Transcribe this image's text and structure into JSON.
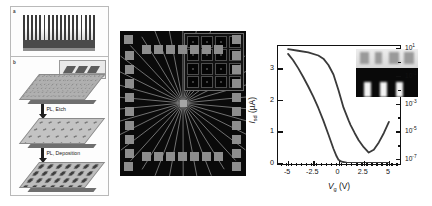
{
  "figure": {
    "panels": {
      "a": {
        "label": "a"
      },
      "b": {
        "label": "b",
        "steps": [
          {
            "arrow_label": "PL, Etch"
          },
          {
            "arrow_label": "PL, Deposition"
          }
        ]
      }
    }
  },
  "chart_data": {
    "type": "line",
    "title": "",
    "xlabel": "Vg (V)",
    "ylabel": "Isd (µA)",
    "xlabel_parts": {
      "symbol": "V",
      "sub": "g",
      "unit": "(V)"
    },
    "ylabel_parts": {
      "symbol": "I",
      "sub": "sd",
      "unit": "(µA)"
    },
    "grid": false,
    "legend": "none",
    "xlim": [
      -6,
      6
    ],
    "xticks": [
      -5,
      -2.5,
      0,
      2.5,
      5
    ],
    "xticklabels": [
      "-5",
      "-2.5",
      "0",
      "2.5",
      "5"
    ],
    "left_axis": {
      "scale": "linear",
      "ylim": [
        0,
        3.7
      ],
      "yticks": [
        0,
        1,
        2,
        3
      ],
      "yticklabels": [
        "0",
        "1",
        "2",
        "3"
      ]
    },
    "right_axis": {
      "scale": "log",
      "ylim": [
        1e-07,
        30.0
      ],
      "yticks": [
        "10^1",
        "10^-1",
        "10^-3",
        "10^-5",
        "10^-7"
      ],
      "yticklabels": [
        {
          "base": "10",
          "exp": "1"
        },
        {
          "base": "10",
          "exp": "-1"
        },
        {
          "base": "10",
          "exp": "-3"
        },
        {
          "base": "10",
          "exp": "-5"
        },
        {
          "base": "10",
          "exp": "-7"
        }
      ]
    },
    "series": [
      {
        "name": "Isd linear scale",
        "axis": "left",
        "x": [
          -5.0,
          -4.5,
          -4.0,
          -3.5,
          -3.0,
          -2.5,
          -2.0,
          -1.5,
          -1.0,
          -0.5,
          -0.2,
          0.0,
          0.3,
          0.8,
          1.5,
          3.0,
          5.0
        ],
        "y": [
          3.45,
          3.25,
          3.0,
          2.72,
          2.42,
          2.1,
          1.74,
          1.34,
          0.9,
          0.45,
          0.22,
          0.1,
          0.04,
          0.01,
          0.0,
          0.0,
          0.0
        ]
      },
      {
        "name": "Isd log scale",
        "axis": "right",
        "x": [
          -5.0,
          -4.0,
          -3.0,
          -2.0,
          -1.5,
          -1.0,
          -0.5,
          0.0,
          0.5,
          1.0,
          1.2,
          1.6,
          2.0,
          2.5,
          3.0,
          3.5,
          4.0,
          4.5,
          5.0
        ],
        "y": [
          3.6,
          3.55,
          3.5,
          3.4,
          3.3,
          3.1,
          2.8,
          2.3,
          1.75,
          1.35,
          1.2,
          0.95,
          0.72,
          0.5,
          0.33,
          0.42,
          0.65,
          0.95,
          1.3
        ],
        "note": "plotted in left-axis display units; represents log-scale current decade positions"
      }
    ],
    "inset": {
      "description": "grayscale micrograph",
      "position": "top-right"
    }
  },
  "micrograph": {
    "name": "device-micrograph",
    "description": "radial multi-electrode device",
    "inset": {
      "description": "4x4 well array",
      "rows": 4,
      "cols": 4
    }
  },
  "colors": {
    "background": "#ffffff",
    "axis": "#111111",
    "curve": "#3a3a3a",
    "micrograph_bg": "#0a0a0a",
    "pad": "#8d8d8d"
  }
}
